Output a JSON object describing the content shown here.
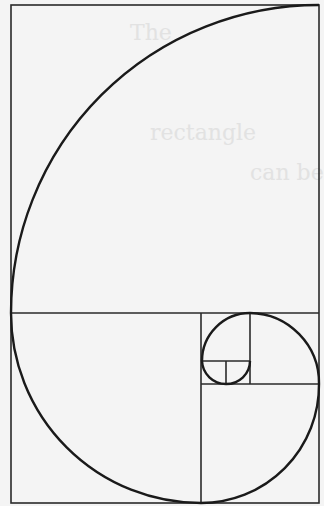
{
  "diagram": {
    "colors": {
      "background": "#f4f4f4",
      "line": "#222222",
      "spiral": "#1a1a1a"
    },
    "rectangle": {
      "x": 11,
      "y": 5,
      "width": 308,
      "height": 498
    },
    "squares": [
      {
        "x": 11,
        "y": 5,
        "size": 308
      },
      {
        "x": 11,
        "y": 313,
        "size": 190
      },
      {
        "x": 201,
        "y": 384,
        "size": 118
      },
      {
        "x": 250,
        "y": 313,
        "size": 71
      },
      {
        "x": 201,
        "y": 313,
        "size": 49
      },
      {
        "x": 201,
        "y": 361,
        "size": 24
      }
    ],
    "background_text": [
      "The",
      "rectangle",
      "can be",
      "ratio"
    ]
  }
}
